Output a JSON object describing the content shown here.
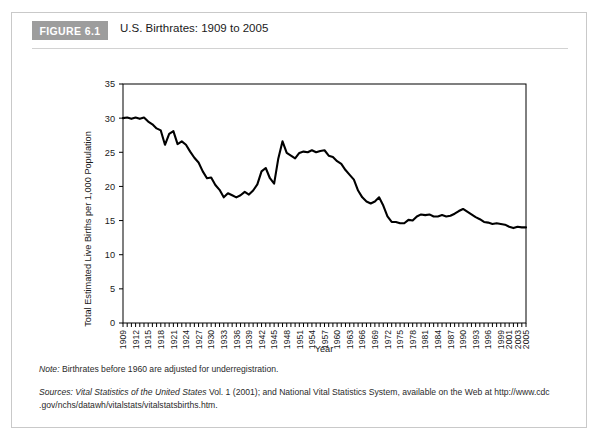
{
  "figure": {
    "tag": "FIGURE 6.1",
    "title": "U.S. Birthrates: 1909 to 2005"
  },
  "notes": {
    "note_label": "Note:",
    "note_text": " Birthrates before 1960 are adjusted for underregistration.",
    "sources_label": "Sources:",
    "sources_italic": " Vital Statistics of the United States",
    "sources_text": " Vol. 1 (2001); and National Vital Statistics System, available on the Web at http://www.cdc",
    "sources_line2": ".gov/nchs/datawh/vitalstats/vitalstatsbirths.htm."
  },
  "chart_data": {
    "type": "line",
    "title": "U.S. Birthrates: 1909 to 2005",
    "xlabel": "Year",
    "ylabel": "Total Estimated Live Births per 1,000 Population",
    "xlim": [
      1909,
      2005
    ],
    "ylim": [
      0,
      35
    ],
    "yticks": [
      0,
      5,
      10,
      15,
      20,
      25,
      30,
      35
    ],
    "grid": false,
    "legend": "none",
    "line_color": "#000000",
    "axis_color": "#000000",
    "xtick_labels": [
      "1909",
      "1912",
      "1915",
      "1918",
      "1921",
      "1924",
      "1927",
      "1930",
      "1933",
      "1936",
      "1939",
      "1942",
      "1945",
      "1948",
      "1951",
      "1954",
      "1957",
      "1960",
      "1963",
      "1966",
      "1969",
      "1972",
      "1975",
      "1978",
      "1981",
      "1984",
      "1987",
      "1990",
      "1993",
      "1996",
      "1999",
      "2001",
      "2003",
      "2005"
    ],
    "x": [
      1909,
      1910,
      1911,
      1912,
      1913,
      1914,
      1915,
      1916,
      1917,
      1918,
      1919,
      1920,
      1921,
      1922,
      1923,
      1924,
      1925,
      1926,
      1927,
      1928,
      1929,
      1930,
      1931,
      1932,
      1933,
      1934,
      1935,
      1936,
      1937,
      1938,
      1939,
      1940,
      1941,
      1942,
      1943,
      1944,
      1945,
      1946,
      1947,
      1948,
      1949,
      1950,
      1951,
      1952,
      1953,
      1954,
      1955,
      1956,
      1957,
      1958,
      1959,
      1960,
      1961,
      1962,
      1963,
      1964,
      1965,
      1966,
      1967,
      1968,
      1969,
      1970,
      1971,
      1972,
      1973,
      1974,
      1975,
      1976,
      1977,
      1978,
      1979,
      1980,
      1981,
      1982,
      1983,
      1984,
      1985,
      1986,
      1987,
      1988,
      1989,
      1990,
      1991,
      1992,
      1993,
      1994,
      1995,
      1996,
      1997,
      1998,
      1999,
      2000,
      2001,
      2002,
      2003,
      2004,
      2005
    ],
    "values": [
      30.0,
      30.1,
      29.9,
      30.1,
      29.9,
      30.1,
      29.5,
      29.1,
      28.5,
      28.2,
      26.1,
      27.7,
      28.1,
      26.2,
      26.6,
      26.1,
      25.1,
      24.2,
      23.5,
      22.2,
      21.2,
      21.3,
      20.2,
      19.5,
      18.4,
      19.0,
      18.7,
      18.4,
      18.7,
      19.2,
      18.8,
      19.4,
      20.3,
      22.2,
      22.7,
      21.2,
      20.4,
      24.1,
      26.6,
      24.9,
      24.5,
      24.1,
      24.9,
      25.1,
      25.0,
      25.3,
      25.0,
      25.2,
      25.3,
      24.5,
      24.3,
      23.7,
      23.3,
      22.4,
      21.7,
      21.0,
      19.4,
      18.4,
      17.8,
      17.5,
      17.8,
      18.4,
      17.2,
      15.6,
      14.8,
      14.8,
      14.6,
      14.6,
      15.1,
      15.0,
      15.6,
      15.9,
      15.8,
      15.9,
      15.6,
      15.6,
      15.8,
      15.6,
      15.7,
      16.0,
      16.4,
      16.7,
      16.3,
      15.9,
      15.5,
      15.2,
      14.8,
      14.7,
      14.5,
      14.6,
      14.5,
      14.4,
      14.1,
      13.9,
      14.1,
      14.0,
      14.0
    ]
  }
}
